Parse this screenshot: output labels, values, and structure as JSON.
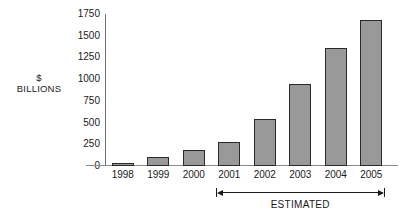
{
  "chart_data": {
    "type": "bar",
    "title": "",
    "subtitle": "",
    "xlabel": "",
    "ylabel": "$ BILLIONS",
    "ylabel_lines": [
      "$",
      "BILLIONS"
    ],
    "categories": [
      "1998",
      "1999",
      "2000",
      "2001",
      "2002",
      "2003",
      "2004",
      "2005"
    ],
    "values": [
      35,
      100,
      180,
      275,
      540,
      940,
      1360,
      1680
    ],
    "ylim": [
      0,
      1750
    ],
    "yticks": [
      0,
      250,
      500,
      750,
      1000,
      1250,
      1500,
      1750
    ],
    "ytick_labels": [
      "0",
      "250",
      "500",
      "750",
      "1000",
      "1250",
      "1500",
      "1750"
    ],
    "grid": false,
    "legend": null,
    "bar_color": "#999999",
    "bar_border_color": "#2a2a2a",
    "axis_color": "#8a8a8a",
    "text_color": "#1a1a1a",
    "annotations": [
      {
        "name": "estimated-range",
        "label": "ESTIMATED",
        "from_category": "2001",
        "to_category": "2005",
        "style": "double-headed-arrow"
      }
    ]
  }
}
